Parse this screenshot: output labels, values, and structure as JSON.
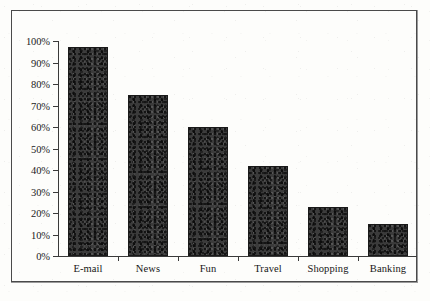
{
  "chart_data": {
    "type": "bar",
    "title": "",
    "subtitle": "",
    "xlabel": "",
    "ylabel": "",
    "categories": [
      "E-mail",
      "News",
      "Fun",
      "Travel",
      "Shopping",
      "Banking"
    ],
    "values": [
      97,
      75,
      60,
      42,
      23,
      15
    ],
    "value_labels": [
      "97%",
      "75%",
      "60%",
      "42%",
      "23%",
      "15%"
    ],
    "ylim": [
      0,
      100
    ],
    "ytick_values": [
      0,
      10,
      20,
      30,
      40,
      50,
      60,
      70,
      80,
      90,
      100
    ],
    "ytick_labels": [
      "0%",
      "10%",
      "20%",
      "30%",
      "40%",
      "50%",
      "60%",
      "70%",
      "80%",
      "90%",
      "100%"
    ],
    "grid": false,
    "legend": null,
    "legend_position": "none",
    "series": [
      {
        "name": "Percentage of users",
        "values": [
          97,
          75,
          60,
          42,
          23,
          15
        ],
        "color": "#3b3b3b"
      }
    ],
    "colors": {
      "bar_fill": "#3b3b3b",
      "bar_border": "#1a1a1a",
      "axis": "#3a3a3a",
      "frame": "#4a4a4a",
      "text": "#161616",
      "background": "#fdfdfb"
    }
  }
}
